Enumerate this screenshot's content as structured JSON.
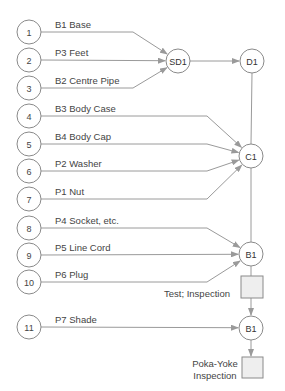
{
  "diagram": {
    "colors": {
      "line": "#9a9a9a",
      "node_stroke": "#8a8a8a",
      "box_fill": "#eeeeee",
      "text": "#444444"
    },
    "inputs": [
      {
        "num": "1",
        "label": "B1 Base",
        "y": 32,
        "target": "SD1"
      },
      {
        "num": "2",
        "label": "P3 Feet",
        "y": 60,
        "target": "SD1"
      },
      {
        "num": "3",
        "label": "B2 Centre Pipe",
        "y": 88,
        "target": "SD1"
      },
      {
        "num": "4",
        "label": "B3 Body Case",
        "y": 116,
        "target": "C1"
      },
      {
        "num": "5",
        "label": "B4 Body Cap",
        "y": 144,
        "target": "C1"
      },
      {
        "num": "6",
        "label": "P2 Washer",
        "y": 171,
        "target": "C1"
      },
      {
        "num": "7",
        "label": "P1 Nut",
        "y": 199,
        "target": "C1"
      },
      {
        "num": "8",
        "label": "P4 Socket, etc.",
        "y": 228,
        "target": "B1"
      },
      {
        "num": "9",
        "label": "P5 Line Cord",
        "y": 255,
        "target": "B1"
      },
      {
        "num": "10",
        "label": "P6 Plug",
        "y": 282,
        "target": "B1"
      },
      {
        "num": "11",
        "label": "P7 Shade",
        "y": 327,
        "target": "B1b"
      }
    ],
    "nodes": {
      "SD1": {
        "label": "SD1",
        "x": 178,
        "y": 61
      },
      "D1": {
        "label": "D1",
        "x": 252,
        "y": 61
      },
      "C1": {
        "label": "C1",
        "x": 251,
        "y": 156
      },
      "B1": {
        "label": "B1",
        "x": 251,
        "y": 254
      },
      "B1b": {
        "label": "B1",
        "x": 251,
        "y": 328
      }
    },
    "inspections": [
      {
        "lines": [
          "Test; Inspection"
        ],
        "box_y": 276
      },
      {
        "lines": [
          "Poka-Yoke",
          "Inspection"
        ],
        "box_y": 357
      }
    ]
  }
}
